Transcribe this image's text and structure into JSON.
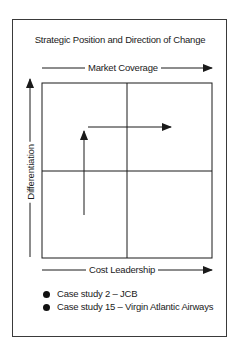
{
  "title": "Strategic Position and Direction of Change",
  "axes": {
    "top": "Market Coverage",
    "bottom": "Cost Leadership",
    "left": "Differentiation"
  },
  "matrix": {
    "rows": 2,
    "cols": 2,
    "arrows": [
      {
        "direction": "up",
        "quadrant": "lower-left to upper-left"
      },
      {
        "direction": "right",
        "quadrant": "upper-left to upper-right"
      }
    ]
  },
  "legend": {
    "items": [
      {
        "label": "Case study 2 – JCB"
      },
      {
        "label": "Case study 15 – Virgin Atlantic Airways"
      }
    ]
  },
  "colors": {
    "line": "#1a1a1a",
    "background": "#ffffff"
  }
}
